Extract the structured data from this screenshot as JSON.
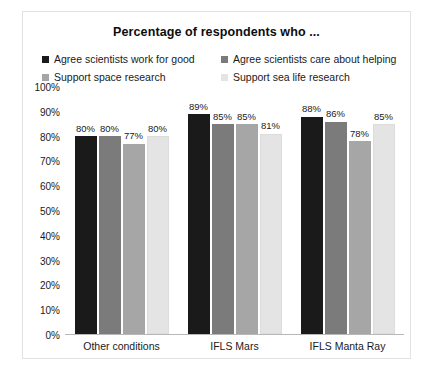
{
  "chart_data": {
    "type": "bar",
    "title": "Percentage of respondents who ...",
    "xlabel": "",
    "ylabel": "",
    "ylim": [
      0,
      100
    ],
    "grid": false,
    "legend_position": "top",
    "categories": [
      "Other conditions",
      "IFLS Mars",
      "IFLS Manta Ray"
    ],
    "y_ticks": [
      "0%",
      "10%",
      "20%",
      "30%",
      "40%",
      "50%",
      "60%",
      "70%",
      "80%",
      "90%",
      "100%"
    ],
    "y_tick_values": [
      0,
      10,
      20,
      30,
      40,
      50,
      60,
      70,
      80,
      90,
      100
    ],
    "series": [
      {
        "name": "Agree scientists work for good",
        "color": "#1a1a1a",
        "values": [
          80,
          89,
          88
        ],
        "labels": [
          "80%",
          "89%",
          "88%"
        ]
      },
      {
        "name": "Agree scientists care about helping",
        "color": "#7b7b7b",
        "values": [
          80,
          85,
          86
        ],
        "labels": [
          "80%",
          "85%",
          "86%"
        ]
      },
      {
        "name": "Support space research",
        "color": "#a6a6a6",
        "values": [
          77,
          85,
          78
        ],
        "labels": [
          "77%",
          "85%",
          "78%"
        ]
      },
      {
        "name": "Support sea life research",
        "color": "#e4e4e4",
        "values": [
          80,
          81,
          85
        ],
        "labels": [
          "80%",
          "81%",
          "85%"
        ]
      }
    ]
  },
  "colors": {
    "background": "#ffffff",
    "frame_border": "#e2e2e2",
    "axis_line": "#b8b8b8",
    "text": "#1a1a1a"
  }
}
